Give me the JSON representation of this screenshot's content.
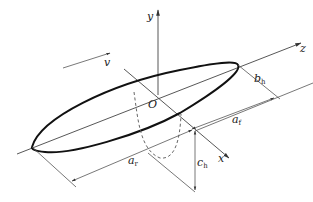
{
  "diagram": {
    "labels": {
      "y_axis": "y",
      "z_axis": "z",
      "x_axis": "x",
      "origin": "O",
      "velocity": "v",
      "b": {
        "main": "b",
        "sub": "h"
      },
      "a_front": {
        "main": "a",
        "sub": "f"
      },
      "a_rear": {
        "main": "a",
        "sub": "r"
      },
      "c": {
        "main": "c",
        "sub": "h"
      }
    }
  }
}
